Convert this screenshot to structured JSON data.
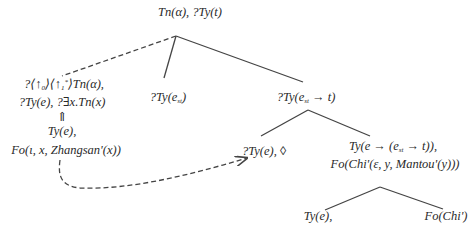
{
  "diagram": {
    "type": "semantic tree (Dynamic Syntax)",
    "nodes": [
      {
        "id": "root",
        "lines": [
          "Tn(α), ?Ty(t)"
        ]
      },
      {
        "id": "linked",
        "lines": [
          "?⟨↑₀⟩⟨↑₁*⟩Tn(α),",
          "?Ty(e), ?∃x.Tn(x)"
        ]
      },
      {
        "id": "linked-arrow",
        "lines": [
          "⇑"
        ]
      },
      {
        "id": "linked-content",
        "lines": [
          "Ty(e),",
          "Fo(ι, x, Zhangsan'(x))"
        ]
      },
      {
        "id": "est",
        "lines": [
          "?Ty(e_st)"
        ]
      },
      {
        "id": "pred",
        "lines": [
          "?Ty(e_st → t)"
        ]
      },
      {
        "id": "obj",
        "lines": [
          "?Ty(e), ◊"
        ]
      },
      {
        "id": "functor",
        "lines": [
          "Ty(e → (e_st → t)),",
          "Fo(Chi'(ε, y, Mantou'(y)))"
        ]
      },
      {
        "id": "leaf-ty",
        "lines": [
          "Ty(e),"
        ]
      },
      {
        "id": "leaf-fo",
        "lines": [
          "Fo(Chi')"
        ]
      }
    ],
    "edges": [
      {
        "from": "root",
        "to": "linked",
        "style": "dashed"
      },
      {
        "from": "root",
        "to": "est",
        "style": "solid"
      },
      {
        "from": "root",
        "to": "pred",
        "style": "solid"
      },
      {
        "from": "pred",
        "to": "obj",
        "style": "solid"
      },
      {
        "from": "pred",
        "to": "functor",
        "style": "solid"
      },
      {
        "from": "functor",
        "to": "leaf-ty",
        "style": "solid"
      },
      {
        "from": "functor",
        "to": "leaf-fo",
        "style": "solid"
      },
      {
        "from": "linked-content",
        "to": "obj",
        "style": "dashed-arrow"
      }
    ]
  },
  "labels": {
    "root": "Tn(α), ?Ty(t)",
    "linked_1a": "?⟨↑",
    "linked_1b": "0",
    "linked_1c": "⟩⟨↑",
    "linked_1d": "1",
    "linked_1e": "*",
    "linked_1f": "⟩Tn(α),",
    "linked_2": "?Ty(e), ?∃x.Tn(x)",
    "uparrow": "⇑",
    "lc_1": "Ty(e),",
    "lc_2": "Fo(ι, x, Zhangsan'(x))",
    "est_a": "?Ty(e",
    "est_sub": "st",
    "est_b": ")",
    "pred_a": "?Ty(e",
    "pred_sub": "st",
    "pred_b": " → t)",
    "obj": "?Ty(e), ◊",
    "fn_1a": "Ty(e → (e",
    "fn_1sub": "st",
    "fn_1b": " → t)),",
    "fn_2": "Fo(Chi'(ε, y, Mantou'(y)))",
    "leaf_ty": "Ty(e),",
    "leaf_fo": "Fo(Chi')"
  },
  "colors": {
    "line": "#444444",
    "text": "#2a2a2a"
  }
}
